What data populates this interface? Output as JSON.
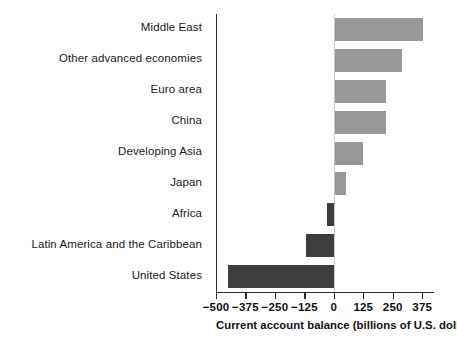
{
  "chart_data": {
    "type": "bar",
    "orientation": "horizontal",
    "title": "",
    "xlabel": "Current account balance (billions of U.S. dollars)",
    "ylabel": "",
    "categories": [
      "Middle East",
      "Other advanced economies",
      "Euro area",
      "China",
      "Developing Asia",
      "Japan",
      "Africa",
      "Latin America and the Caribbean",
      "United States"
    ],
    "values": [
      380,
      290,
      220,
      220,
      125,
      50,
      -28,
      -120,
      -450
    ],
    "xlim": [
      -500,
      425
    ],
    "xticks": [
      -500,
      -375,
      -250,
      -125,
      0,
      125,
      250,
      375
    ],
    "xticklabels": [
      "−500",
      "−375",
      "−250",
      "−125",
      "0",
      "125",
      "250",
      "375"
    ],
    "grid": false,
    "legend": null,
    "colors": {
      "positive_bar": "#989898",
      "negative_bar": "#3d3d3d",
      "axis": "#2a2a2a",
      "zero_line": "#c9c9c9",
      "text": "#111111",
      "background": "#ffffff"
    }
  }
}
